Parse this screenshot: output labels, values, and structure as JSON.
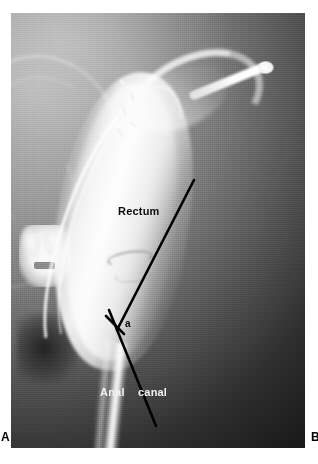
{
  "figure": {
    "modality": "defecography-radiograph",
    "panel_letters": {
      "left": "A",
      "right": "B"
    }
  },
  "plate": {
    "anatomy_labels": {
      "rectum": "Rectum",
      "anal_canal_word1": "Anal",
      "anal_canal_word2": "canal",
      "anorectal_angle_marker": "a"
    },
    "annotation_lines": [
      {
        "name": "rectal-axis-line",
        "x1": 194,
        "y1": 180,
        "x2": 117,
        "y2": 330
      },
      {
        "name": "anal-canal-axis-line",
        "x1": 109,
        "y1": 310,
        "x2": 156,
        "y2": 426
      },
      {
        "name": "angle-tick-mark",
        "x1": 106,
        "y1": 316,
        "x2": 124,
        "y2": 334
      }
    ],
    "colors": {
      "label_dark": "#0d0d0d",
      "label_light": "#f2f2f2",
      "annotation_line": "#000000",
      "page_background": "#ffffff"
    }
  }
}
